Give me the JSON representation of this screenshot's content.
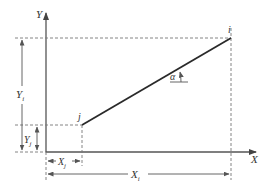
{
  "diagram": {
    "type": "coordinate-geometry",
    "colors": {
      "line": "#2a2a2a",
      "axis": "#555555",
      "dashed": "#777777",
      "text": "#333333"
    },
    "axes": {
      "x_label": "X",
      "y_label": "Y"
    },
    "points": {
      "j": {
        "label": "j",
        "px": [
          82,
          125
        ]
      },
      "i": {
        "label": "i",
        "px": [
          231,
          38
        ]
      }
    },
    "dimensions": {
      "xi": {
        "label": "X",
        "sub": "i"
      },
      "xj": {
        "label": "X",
        "sub": "j"
      },
      "yi": {
        "label": "Y",
        "sub": "i"
      },
      "yj": {
        "label": "Y",
        "sub": "j"
      }
    },
    "angle": {
      "label": "α"
    }
  }
}
